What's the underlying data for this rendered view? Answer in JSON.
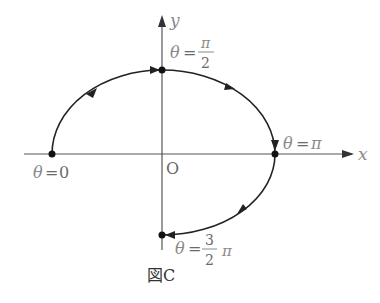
{
  "figure": {
    "caption": "図C",
    "axes": {
      "x_label": "x",
      "y_label": "y",
      "origin_label": "O"
    },
    "points": [
      {
        "id": "theta0",
        "theta": "0",
        "label_lhs": "θ",
        "label_eq": "=",
        "label_rhs": "0"
      },
      {
        "id": "theta_pi_2",
        "theta": "π/2",
        "label_lhs": "θ",
        "label_eq": "=",
        "num": "π",
        "den": "2"
      },
      {
        "id": "theta_pi",
        "theta": "π",
        "label_lhs": "θ",
        "label_eq": "=",
        "label_rhs": "π"
      },
      {
        "id": "theta_3pi_2",
        "theta": "3π/2",
        "label_lhs": "θ",
        "label_eq": "=",
        "num": "3",
        "den": "2",
        "suffix": "π"
      }
    ],
    "curve": {
      "description": "Clockwise path from θ=0 through θ=π/2, θ=π to θ=3π/2",
      "color": "#1a1a1a"
    }
  }
}
